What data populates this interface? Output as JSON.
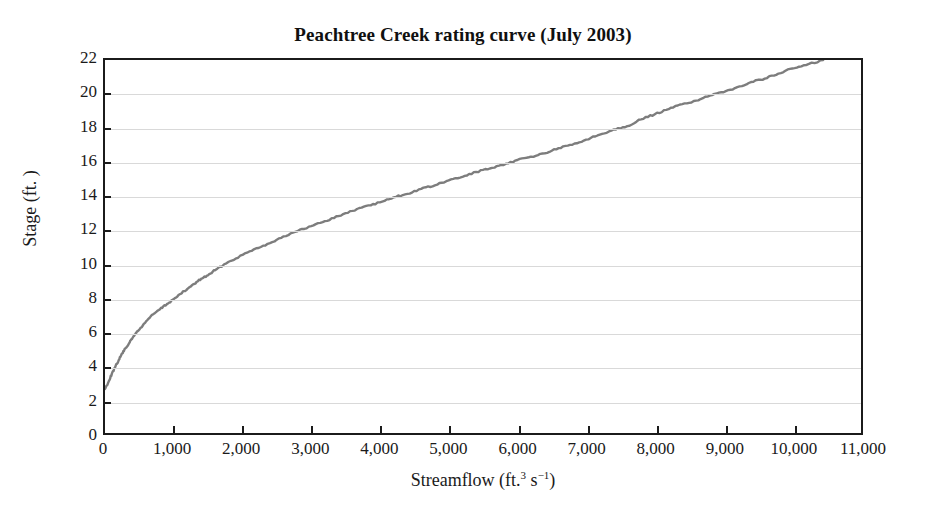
{
  "chart_data": {
    "type": "line",
    "title": "Peachtree Creek rating curve (July 2003)",
    "xlabel_text": "Streamflow (ft.",
    "xlabel_sup1": "3",
    "xlabel_mid": " s",
    "xlabel_sup2": "−1",
    "xlabel_end": ")",
    "xlabel_plain": "Streamflow (ft.3 s-1)",
    "ylabel": "Stage (ft. )",
    "xlim": [
      0,
      11000
    ],
    "ylim": [
      0,
      22
    ],
    "xticks": [
      0,
      1000,
      2000,
      3000,
      4000,
      5000,
      6000,
      7000,
      8000,
      9000,
      10000,
      11000
    ],
    "xtick_labels": [
      "0",
      "1,000",
      "2,000",
      "3,000",
      "4,000",
      "5,000",
      "6,000",
      "7,000",
      "8,000",
      "9,000",
      "10,000",
      "11,000"
    ],
    "yticks": [
      0,
      2,
      4,
      6,
      8,
      10,
      12,
      14,
      16,
      18,
      20,
      22
    ],
    "ytick_labels": [
      "0",
      "2",
      "4",
      "6",
      "8",
      "10",
      "12",
      "14",
      "16",
      "18",
      "20",
      "22"
    ],
    "grid": "horizontal",
    "grid_color": "#d9d9d9",
    "legend": "none",
    "series": [
      {
        "name": "rating curve",
        "color": "#7d7d7d",
        "line_width": 2.4,
        "x": [
          0,
          50,
          100,
          150,
          200,
          250,
          300,
          350,
          400,
          450,
          500,
          600,
          700,
          800,
          900,
          1000,
          1100,
          1200,
          1300,
          1400,
          1500,
          1600,
          1800,
          2000,
          2200,
          2400,
          2600,
          2800,
          3000,
          3200,
          3400,
          3600,
          3800,
          4000,
          4200,
          4400,
          4600,
          4800,
          5000,
          5200,
          5400,
          5600,
          5800,
          6000,
          6200,
          6400,
          6600,
          6800,
          7000,
          7200,
          7400,
          7600,
          7800,
          8000,
          8200,
          8400,
          8600,
          8800,
          9000,
          9200,
          9400,
          9600,
          9800,
          10000,
          10200,
          10450
        ],
        "y": [
          2.6,
          3.0,
          3.5,
          3.9,
          4.3,
          4.7,
          5.0,
          5.3,
          5.6,
          5.9,
          6.1,
          6.6,
          7.0,
          7.3,
          7.6,
          7.9,
          8.2,
          8.5,
          8.8,
          9.1,
          9.3,
          9.6,
          10.1,
          10.5,
          10.9,
          11.2,
          11.6,
          11.9,
          12.2,
          12.5,
          12.8,
          13.1,
          13.4,
          13.6,
          13.9,
          14.1,
          14.4,
          14.6,
          14.9,
          15.1,
          15.4,
          15.6,
          15.8,
          16.1,
          16.3,
          16.5,
          16.8,
          17.0,
          17.3,
          17.6,
          17.9,
          18.1,
          18.5,
          18.8,
          19.1,
          19.4,
          19.6,
          19.9,
          20.1,
          20.4,
          20.7,
          20.9,
          21.2,
          21.5,
          21.7,
          22.0
        ]
      }
    ]
  }
}
